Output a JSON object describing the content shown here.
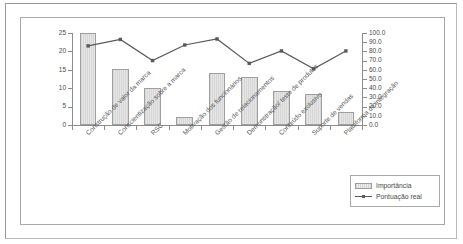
{
  "chart_data": {
    "type": "bar",
    "title": "",
    "xlabel": "",
    "ylabel": "",
    "grid": false,
    "legend_position": "bottom-right",
    "categories": [
      "Construção de valor da marca",
      "Conscientização sobre a marca",
      "RSC",
      "Motivação dos funcionários",
      "Gestão de relacionamentos",
      "Demonstração/ teste de produtos",
      "Conteúdo exclusivo",
      "Suporte de vendas",
      "Plataforma de integração"
    ],
    "series": [
      {
        "name": "Importância",
        "type": "bar",
        "axis": "left",
        "values": [
          25.0,
          15.1,
          10.1,
          2.2,
          14.2,
          13.1,
          9.3,
          8.5,
          3.5
        ]
      },
      {
        "name": "Pontuação real",
        "type": "line",
        "axis": "right",
        "values": [
          86.0,
          93.0,
          70.0,
          87.0,
          93.5,
          67.0,
          80.5,
          61.0,
          80.5
        ]
      }
    ],
    "left_axis": {
      "min": 0,
      "max": 25,
      "ticks": [
        "0",
        "5",
        "10",
        "15",
        "20",
        "25"
      ],
      "tick_values": [
        0,
        5,
        10,
        15,
        20,
        25
      ]
    },
    "right_axis": {
      "min": 0,
      "max": 100,
      "ticks": [
        "0.0",
        "10.0",
        "20.0",
        "30.0",
        "40.0",
        "50.0",
        "60.0",
        "70.0",
        "80.0",
        "90.0",
        "100.0"
      ],
      "tick_values": [
        0,
        10,
        20,
        30,
        40,
        50,
        60,
        70,
        80,
        90,
        100
      ]
    },
    "colors": {
      "bar_fill": "#dcdcdc",
      "bar_stroke": "#9f9f9f",
      "line": "#58595b",
      "marker": "#58595b",
      "axis": "#8d8d8d",
      "text": "#4a4a4a",
      "background": "#ffffff"
    }
  },
  "legend": {
    "items": [
      {
        "label": "Importância",
        "marker": "bar-swatch"
      },
      {
        "label": "Pontuação real",
        "marker": "line-swatch"
      }
    ]
  }
}
